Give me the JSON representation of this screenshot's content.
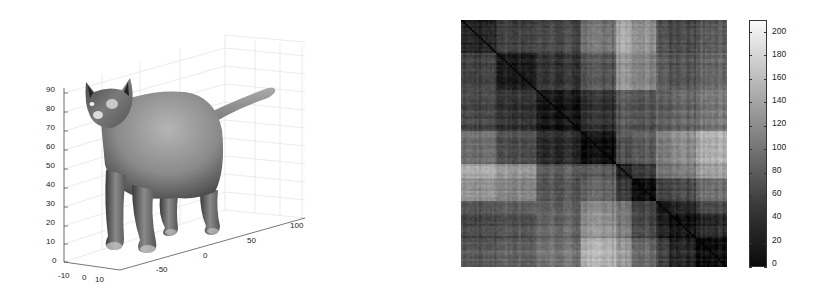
{
  "chart_data": [
    {
      "type": "surface3d",
      "title": "",
      "description": "3D shaded mesh of a standing cat rendered in a MATLAB-style 3D axes with light grid",
      "axes": {
        "z": {
          "ticks": [
            0,
            10,
            20,
            30,
            40,
            50,
            60,
            70,
            80,
            90
          ],
          "range": [
            0,
            95
          ]
        },
        "x": {
          "ticks": [
            -10,
            0,
            10
          ]
        },
        "y": {
          "ticks": [
            -50,
            0,
            50,
            100
          ]
        }
      },
      "grid": true,
      "colormap": "gray"
    },
    {
      "type": "heatmap",
      "title": "",
      "description": "Pairwise distance matrix (symmetric), dark diagonal with block structure",
      "xlabel": "",
      "ylabel": "",
      "colorbar": {
        "ticks": [
          0,
          20,
          40,
          60,
          80,
          100,
          120,
          140,
          160,
          180,
          200
        ],
        "range": [
          0,
          210
        ]
      },
      "colormap": "gray",
      "block_boundaries": [
        0,
        0.13,
        0.28,
        0.45,
        0.58,
        0.64,
        0.73,
        0.78,
        0.88,
        1.0
      ],
      "block_values": [
        [
          30,
          55,
          60,
          95,
          140,
          120,
          70,
          60,
          75
        ],
        [
          55,
          25,
          45,
          70,
          125,
          110,
          80,
          70,
          85
        ],
        [
          60,
          45,
          20,
          40,
          75,
          70,
          80,
          85,
          100
        ],
        [
          95,
          70,
          40,
          15,
          70,
          80,
          110,
          120,
          150
        ],
        [
          140,
          125,
          75,
          70,
          25,
          45,
          95,
          100,
          130
        ],
        [
          120,
          110,
          70,
          80,
          45,
          10,
          55,
          60,
          90
        ],
        [
          70,
          80,
          80,
          110,
          95,
          55,
          20,
          30,
          60
        ],
        [
          60,
          70,
          85,
          120,
          100,
          60,
          30,
          15,
          35
        ],
        [
          75,
          85,
          100,
          150,
          130,
          90,
          60,
          35,
          15
        ]
      ]
    }
  ],
  "left_plot": {
    "z_ticks": [
      "90",
      "80",
      "70",
      "60",
      "50",
      "40",
      "30",
      "20",
      "10",
      "0"
    ],
    "x_ticks": [
      "-10",
      "0",
      "10"
    ],
    "y_ticks": [
      "-50",
      "0",
      "50",
      "100"
    ]
  },
  "colorbar": {
    "labels": [
      "200",
      "180",
      "160",
      "140",
      "120",
      "100",
      "80",
      "60",
      "40",
      "20",
      "0"
    ]
  }
}
